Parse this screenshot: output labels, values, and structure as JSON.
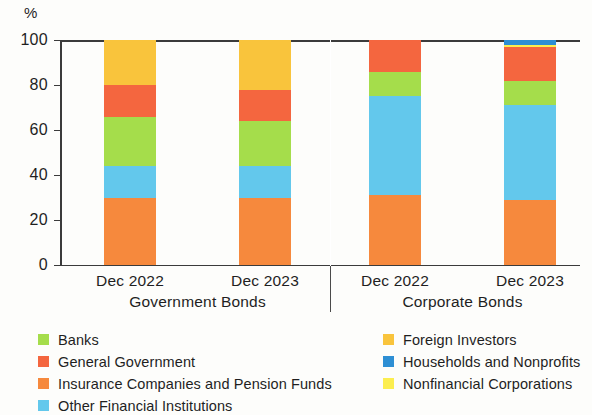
{
  "chart_data": {
    "type": "bar",
    "title": "",
    "subtitle": "",
    "stacked": true,
    "stack_total": 100,
    "unit_label": "%",
    "xlabel": "",
    "ylabel": "",
    "ylim": [
      0,
      100
    ],
    "yticks": [
      0,
      20,
      40,
      60,
      80,
      100
    ],
    "ytick_labels": [
      "0",
      "20",
      "40",
      "60",
      "80",
      "100"
    ],
    "grid": false,
    "legend_position": "bottom",
    "categories": [
      "Dec 2022",
      "Dec 2023",
      "Dec 2022",
      "Dec 2023"
    ],
    "groups": [
      {
        "label": "Government Bonds",
        "categories": [
          "Dec 2022",
          "Dec 2023"
        ]
      },
      {
        "label": "Corporate Bonds",
        "categories": [
          "Dec 2022",
          "Dec 2023"
        ]
      }
    ],
    "series": [
      {
        "name": "Insurance Companies and Pension Funds",
        "color": "#F6893D",
        "values": [
          30,
          30,
          31,
          29
        ]
      },
      {
        "name": "Other Financial Institutions",
        "color": "#63C8EC",
        "values": [
          14,
          14,
          44,
          42
        ]
      },
      {
        "name": "Banks",
        "color": "#A5DD4B",
        "values": [
          22,
          20,
          11,
          11
        ]
      },
      {
        "name": "General Government",
        "color": "#F4663F",
        "values": [
          14,
          14,
          14,
          15
        ]
      },
      {
        "name": "Nonfinancial Corporations",
        "color": "#FCEE4F",
        "values": [
          0,
          0,
          0,
          1
        ]
      },
      {
        "name": "Households and Nonprofits",
        "color": "#2E8FD4",
        "values": [
          0,
          0,
          0,
          2
        ]
      },
      {
        "name": "Foreign Investors",
        "color": "#F9C43C",
        "values": [
          20,
          22,
          0,
          0
        ]
      }
    ],
    "legend_entries_left": [
      {
        "label": "Banks",
        "color": "#A5DD4B"
      },
      {
        "label": "General Government",
        "color": "#F4663F"
      },
      {
        "label": "Insurance Companies and Pension Funds",
        "color": "#F6893D"
      },
      {
        "label": "Other Financial Institutions",
        "color": "#63C8EC"
      }
    ],
    "legend_entries_right": [
      {
        "label": "Foreign Investors",
        "color": "#F9C43C"
      },
      {
        "label": "Households and Nonprofits",
        "color": "#2E8FD4"
      },
      {
        "label": "Nonfinancial Corporations",
        "color": "#FCEE4F"
      }
    ]
  }
}
